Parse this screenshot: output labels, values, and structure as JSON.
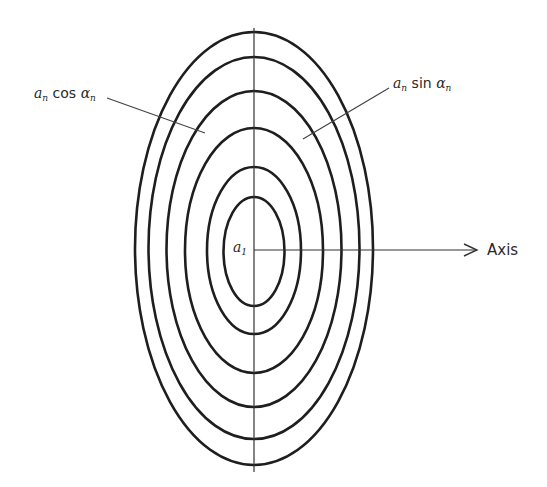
{
  "diagram": {
    "type": "concentric-ellipses",
    "stroke_color": "#1e1e1e",
    "background": "#ffffff",
    "center": {
      "x": 254,
      "y": 249
    },
    "ellipses": [
      {
        "rx": 30.5,
        "ry": 54.5,
        "cy": 251.5
      },
      {
        "rx": 47,
        "ry": 83.5,
        "cy": 250.5
      },
      {
        "rx": 69,
        "ry": 122.5,
        "cy": 250.5
      },
      {
        "rx": 87.5,
        "ry": 158,
        "cy": 249
      },
      {
        "rx": 105.5,
        "ry": 191,
        "cy": 248
      },
      {
        "rx": 119,
        "ry": 216.5,
        "cy": 248.5
      }
    ],
    "vertical_axis": {
      "x": 254,
      "y1": 28,
      "y2": 472
    },
    "horizontal_axis": {
      "x1": 254,
      "x2": 476,
      "y": 250
    }
  },
  "labels": {
    "cos_label": {
      "a": "a",
      "a_sub": "n",
      "func": "cos",
      "alpha": "α",
      "alpha_sub": "n"
    },
    "sin_label": {
      "a": "a",
      "a_sub": "n",
      "func": "sin",
      "alpha": "α",
      "alpha_sub": "n"
    },
    "center_label": {
      "a": "a",
      "a_sub": "1"
    },
    "axis_label": "Axis"
  }
}
